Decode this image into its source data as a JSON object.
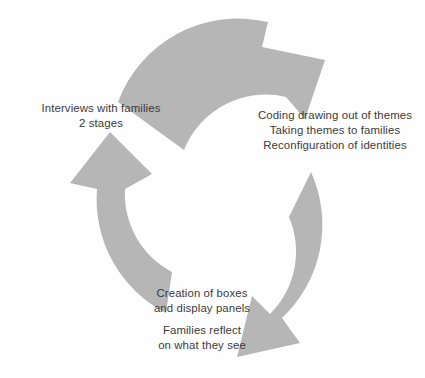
{
  "diagram": {
    "shape_color": "#b6b6b6",
    "text_color": "#3b3b3b",
    "background_color": "#fefefe",
    "arrows": [
      {
        "name": "top-arrow",
        "direction": "clockwise-top",
        "points_to": "coding-stage"
      },
      {
        "name": "right-arrow",
        "direction": "clockwise-right",
        "points_to": "creation-stage"
      },
      {
        "name": "left-arrow",
        "direction": "clockwise-left",
        "points_to": "interviews-stage"
      }
    ],
    "labels": {
      "interviews": {
        "lines": [
          "Interviews with families",
          "2 stages"
        ]
      },
      "coding": {
        "lines": [
          "Coding drawing out of themes",
          "Taking themes to families",
          "Reconfiguration of identities"
        ]
      },
      "creation": {
        "lines": [
          "Creation of boxes",
          "and display panels"
        ]
      },
      "reflect": {
        "lines": [
          "Families reflect",
          "on what they see"
        ]
      }
    }
  }
}
